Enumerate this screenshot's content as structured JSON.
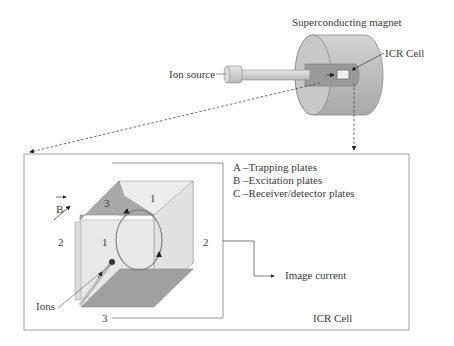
{
  "magnet": {
    "title": "Superconducting magnet",
    "ion_source_label": "Ion source",
    "icr_cell_label": "ICR Cell"
  },
  "inset": {
    "legend": [
      "A –Trapping plates",
      "B –Excitation plates",
      "C –Receiver/detector plates"
    ],
    "b_field_label": "B",
    "ions_label": "Ions",
    "image_current_label": "Image current",
    "box_caption": "ICR Cell",
    "plate_numbers": {
      "top": "3",
      "bottom": "3",
      "back_right": "1",
      "front": "1",
      "left": "2",
      "right": "2"
    }
  }
}
